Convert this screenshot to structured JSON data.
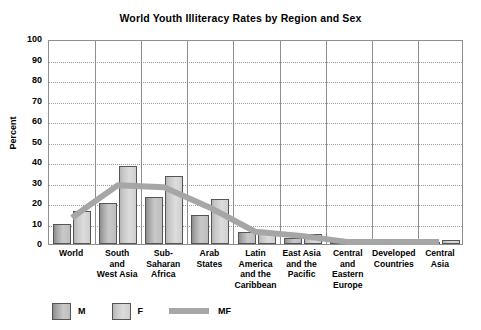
{
  "chart_data": {
    "type": "bar",
    "title": "World Youth Illiteracy Rates by Region and Sex",
    "xlabel": "",
    "ylabel": "Percent",
    "ylim": [
      0,
      100
    ],
    "ytick_step": 10,
    "grid": true,
    "legend_position": "bottom-left",
    "categories": [
      "World",
      "South and West Asia",
      "Sub-Saharan Africa",
      "Arab States",
      "Latin America and the Caribbean",
      "East Asia and the Pacific",
      "Central and Eastern Europe",
      "Developed Countries",
      "Central Asia"
    ],
    "category_lines": [
      [
        "World"
      ],
      [
        "South",
        "and",
        "West Asia"
      ],
      [
        "Sub-",
        "Saharan",
        "Africa"
      ],
      [
        "Arab",
        "States"
      ],
      [
        "Latin",
        "America",
        "and the",
        "Caribbean"
      ],
      [
        "East Asia",
        "and the",
        "Pacific"
      ],
      [
        "Central",
        "and",
        "Eastern",
        "Europe"
      ],
      [
        "Developed",
        "Countries"
      ],
      [
        "Central",
        "Asia"
      ]
    ],
    "series": [
      {
        "name": "M",
        "values": [
          10,
          20,
          23,
          14,
          6,
          3,
          1,
          1,
          1
        ]
      },
      {
        "name": "F",
        "values": [
          16,
          38,
          33,
          22,
          6,
          5,
          1,
          1,
          2
        ]
      },
      {
        "name": "MF",
        "type": "line",
        "values": [
          13,
          29,
          28,
          18,
          6,
          4,
          1,
          1,
          1
        ]
      }
    ],
    "ytick_labels": [
      "100",
      "90",
      "80",
      "70",
      "60",
      "50",
      "40",
      "30",
      "20",
      "10",
      "0"
    ]
  },
  "legend": {
    "items": [
      {
        "label": "M",
        "kind": "box",
        "color": "#a8a8a8"
      },
      {
        "label": "F",
        "kind": "box",
        "color": "#d2d2d2"
      },
      {
        "label": "MF",
        "kind": "line",
        "color": "#a6a6a6"
      }
    ]
  },
  "colors": {
    "frame": "#8e8e8e",
    "grid": "#9a9a9a",
    "bar_m": "#a8a8a8",
    "bar_f": "#d2d2d2",
    "trend": "#a6a6a6",
    "background": "#ffffff",
    "text": "#000000"
  }
}
